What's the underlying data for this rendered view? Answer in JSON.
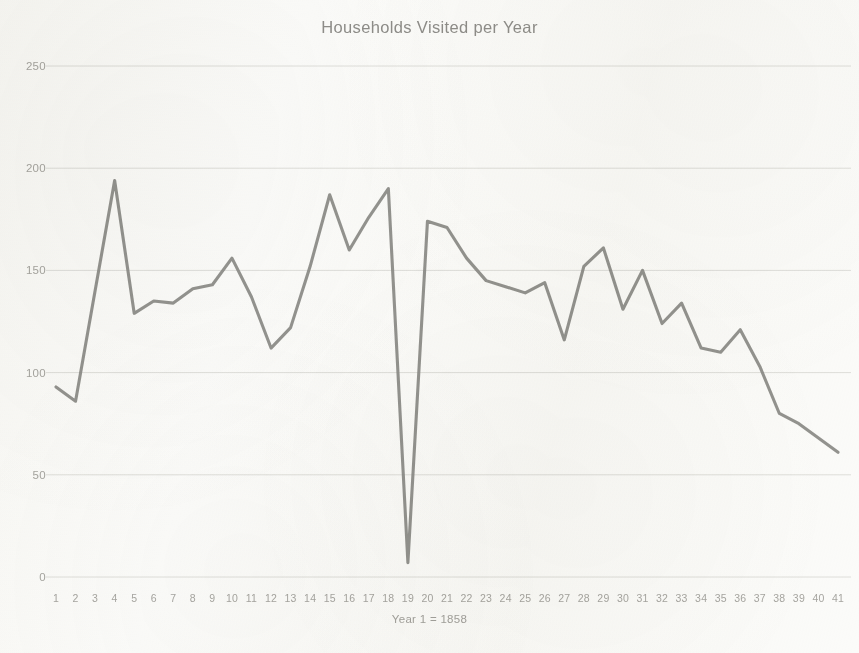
{
  "chart_data": {
    "type": "line",
    "title": "Households Visited per Year",
    "xlabel": "Year 1 = 1858",
    "ylabel": "",
    "x": [
      1,
      2,
      3,
      4,
      5,
      6,
      7,
      8,
      9,
      10,
      11,
      12,
      13,
      14,
      15,
      16,
      17,
      18,
      19,
      20,
      21,
      22,
      23,
      24,
      25,
      26,
      27,
      28,
      29,
      30,
      31,
      32,
      33,
      34,
      35,
      36,
      37,
      38,
      39,
      40,
      41
    ],
    "categories": [
      "1",
      "2",
      "3",
      "4",
      "5",
      "6",
      "7",
      "8",
      "9",
      "10",
      "11",
      "12",
      "13",
      "14",
      "15",
      "16",
      "17",
      "18",
      "19",
      "20",
      "21",
      "22",
      "23",
      "24",
      "25",
      "26",
      "27",
      "28",
      "29",
      "30",
      "31",
      "32",
      "33",
      "34",
      "35",
      "36",
      "37",
      "38",
      "39",
      "40",
      "41"
    ],
    "values": [
      93,
      86,
      140,
      194,
      129,
      135,
      134,
      141,
      143,
      156,
      137,
      112,
      122,
      152,
      187,
      160,
      176,
      190,
      7,
      174,
      171,
      156,
      145,
      142,
      139,
      144,
      116,
      152,
      161,
      131,
      150,
      124,
      134,
      112,
      110,
      121,
      103,
      80,
      75,
      68,
      61
    ],
    "series": [
      {
        "name": "Households Visited",
        "values": [
          93,
          86,
          140,
          194,
          129,
          135,
          134,
          141,
          143,
          156,
          137,
          112,
          122,
          152,
          187,
          160,
          176,
          190,
          7,
          174,
          171,
          156,
          145,
          142,
          139,
          144,
          116,
          152,
          161,
          131,
          150,
          124,
          134,
          112,
          110,
          121,
          103,
          80,
          75,
          68,
          61
        ]
      }
    ],
    "xlim": [
      1,
      41
    ],
    "ylim": [
      0,
      250
    ],
    "ytick_labels": [
      "0",
      "50",
      "100",
      "150",
      "200",
      "250"
    ],
    "yticks": [
      0,
      50,
      100,
      150,
      200,
      250
    ],
    "grid": true,
    "grid_axis": "y",
    "legend": false,
    "legend_position": "none",
    "line_color": "#8a8a86",
    "grid_color": "#dededa",
    "text_color": "#a6a5a0",
    "title_color": "#8e8d89",
    "background_color": "#fbfbf9"
  }
}
